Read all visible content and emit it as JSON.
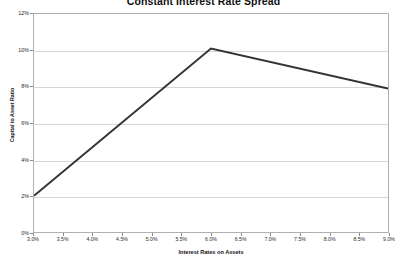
{
  "chart_data": {
    "type": "line",
    "title": "Constant Interest Rate Spread",
    "xlabel": "Interest Rates on Assets",
    "ylabel": "Capital to Asset Ratio",
    "xlim": [
      3.0,
      9.0
    ],
    "ylim": [
      0,
      12
    ],
    "grid": true,
    "legend": "none",
    "x_tick_labels": [
      "3.0%",
      "3.5%",
      "4.0%",
      "4.5%",
      "5.0%",
      "5.5%",
      "6.0%",
      "6.5%",
      "7.0%",
      "7.5%",
      "8.0%",
      "8.5%",
      "9.0%"
    ],
    "x_tick_values": [
      3.0,
      3.5,
      4.0,
      4.5,
      5.0,
      5.5,
      6.0,
      6.5,
      7.0,
      7.5,
      8.0,
      8.5,
      9.0
    ],
    "y_tick_labels": [
      "0%",
      "2%",
      "4%",
      "6%",
      "8%",
      "10%",
      "12%"
    ],
    "y_tick_values": [
      0,
      2,
      4,
      6,
      8,
      10,
      12
    ],
    "series": [
      {
        "name": "Capital to Asset Ratio",
        "color": "#333333",
        "x": [
          3.0,
          6.0,
          9.0
        ],
        "values": [
          2.0,
          10.1,
          7.9
        ]
      }
    ]
  },
  "colors": {
    "line": "#333333",
    "grid": "#d6d6d6",
    "frame": "#b0b0b0",
    "text": "#2b2b2b",
    "background": "#ffffff"
  }
}
